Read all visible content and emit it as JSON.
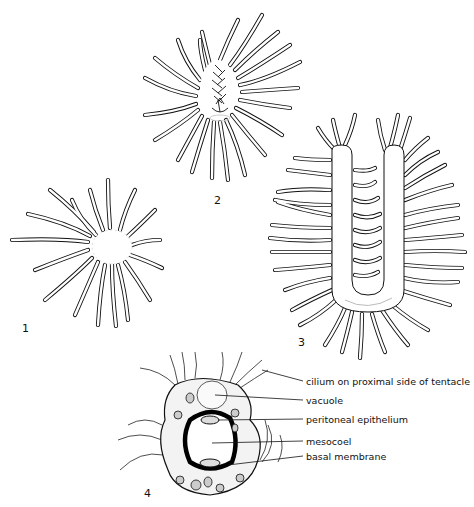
{
  "figure": {
    "panels": [
      {
        "number": "1",
        "subject": "circular lophophore with radiating tentacles"
      },
      {
        "number": "2",
        "subject": "horseshoe-shaped lophophore with tentacles"
      },
      {
        "number": "3",
        "subject": "U-shaped elongated lophophore with many tentacles"
      },
      {
        "number": "4",
        "subject": "cross-section of tentacle"
      }
    ],
    "labels": [
      {
        "id": "cilium",
        "text": "cilium on proximal side of tentacle"
      },
      {
        "id": "vacuole",
        "text": "vacuole"
      },
      {
        "id": "peritoneal",
        "text": "peritoneal epithelium"
      },
      {
        "id": "mesocoel",
        "text": "mesocoel"
      },
      {
        "id": "basal",
        "text": "basal membrane"
      }
    ]
  },
  "colors": {
    "ink": "#111111",
    "background": "#ffffff",
    "stipple": "#d8d8d8"
  }
}
